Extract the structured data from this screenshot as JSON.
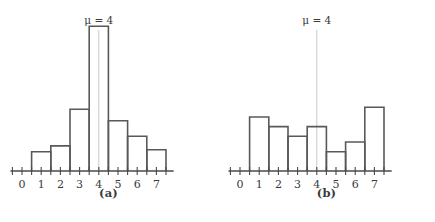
{
  "figure": {
    "background": "#ffffff",
    "bar_stroke_color": "#595959",
    "axis_color": "#4a4a4a",
    "mu_line_color": "#c9c9c9",
    "label_color": "#3a3a3a"
  },
  "panels": [
    {
      "key": "a",
      "caption": "(a)",
      "mu_label": "μ = 4",
      "mu_value": 4,
      "chart_data": {
        "type": "bar",
        "title": "",
        "subtitle": "",
        "xlabel": "",
        "ylabel": "",
        "categories": [
          "0",
          "1",
          "2",
          "3",
          "4",
          "5",
          "6",
          "7"
        ],
        "tick_labels": [
          "0",
          "1",
          "2",
          "3",
          "4",
          "5",
          "6",
          "7"
        ],
        "values": [
          0,
          1.0,
          1.3,
          3.2,
          7.5,
          2.6,
          1.8,
          1.1
        ],
        "xlim": [
          -0.6,
          7.9
        ],
        "ylim": [
          0,
          8.2
        ],
        "grid": false,
        "legend": null,
        "annotations": [
          {
            "text": "μ = 4",
            "x": 4,
            "type": "mean-line"
          }
        ],
        "bar_width": 1,
        "note": "symmetric unimodal histogram centered at 4"
      }
    },
    {
      "key": "b",
      "caption": "(b)",
      "mu_label": "μ = 4",
      "mu_value": 4,
      "chart_data": {
        "type": "bar",
        "title": "",
        "subtitle": "",
        "xlabel": "",
        "ylabel": "",
        "categories": [
          "0",
          "1",
          "2",
          "3",
          "4",
          "5",
          "6",
          "7"
        ],
        "tick_labels": [
          "0",
          "1",
          "2",
          "3",
          "4",
          "5",
          "6",
          "7"
        ],
        "values": [
          0,
          2.8,
          2.3,
          1.8,
          2.3,
          1.0,
          1.5,
          3.3
        ],
        "xlim": [
          -0.6,
          7.9
        ],
        "ylim": [
          0,
          8.2
        ],
        "grid": false,
        "legend": null,
        "annotations": [
          {
            "text": "μ = 4",
            "x": 4,
            "type": "mean-line"
          }
        ],
        "bar_width": 1,
        "note": "irregular spread histogram with same mean 4"
      }
    }
  ]
}
